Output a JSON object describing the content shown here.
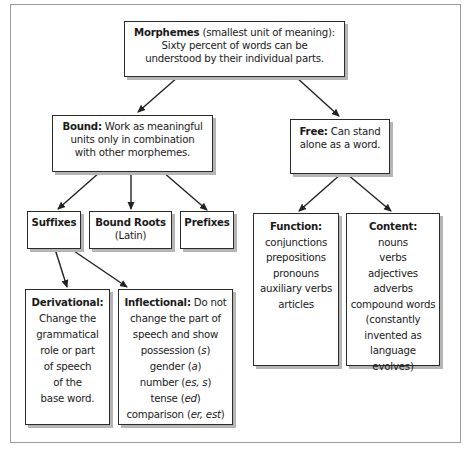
{
  "diagram": {
    "title": "Morphemes",
    "nodes": {
      "morphemes": {
        "heading": "Morphemes",
        "heading_suffix": " (smallest unit of meaning):",
        "lines": [
          "Sixty percent of words can be",
          "understood by their individual parts."
        ]
      },
      "bound": {
        "heading": "Bound:",
        "heading_suffix": " Work as meaningful",
        "lines": [
          "units only in combination",
          "with other morphemes."
        ]
      },
      "free": {
        "heading": "Free:",
        "heading_suffix": " Can stand",
        "lines": [
          "alone as a word."
        ]
      },
      "suffixes": {
        "heading": "Suffixes"
      },
      "bound_roots": {
        "heading": "Bound Roots",
        "lines": [
          "(Latin)"
        ]
      },
      "prefixes": {
        "heading": "Prefixes"
      },
      "function": {
        "heading": "Function:",
        "lines": [
          "conjunctions",
          "prepositions",
          "pronouns",
          "auxiliary verbs",
          "articles"
        ]
      },
      "content": {
        "heading": "Content:",
        "lines": [
          "nouns",
          "verbs",
          "adjectives",
          "adverbs",
          "compound words",
          "(constantly",
          "invented as",
          "language evolves)"
        ]
      },
      "derivational": {
        "heading": "Derivational:",
        "lines": [
          "Change the",
          "grammatical",
          "role or part",
          "of speech",
          "of the",
          "base word."
        ]
      },
      "inflectional": {
        "heading": "Inflectional:",
        "heading_suffix": " Do not",
        "lines": [
          "change the part of",
          "speech and show"
        ],
        "examples": [
          {
            "label": "possession (",
            "affix": "s",
            "close": ")"
          },
          {
            "label": "gender (",
            "affix": "a",
            "close": ")"
          },
          {
            "label": "number (",
            "affix": "es, s",
            "close": ")"
          },
          {
            "label": "tense (",
            "affix": "ed",
            "close": ")"
          },
          {
            "label": "comparison (",
            "affix": "er, est",
            "close": ")"
          }
        ]
      }
    },
    "edges": [
      [
        "morphemes",
        "bound"
      ],
      [
        "morphemes",
        "free"
      ],
      [
        "bound",
        "suffixes"
      ],
      [
        "bound",
        "bound_roots"
      ],
      [
        "bound",
        "prefixes"
      ],
      [
        "free",
        "function"
      ],
      [
        "free",
        "content"
      ],
      [
        "suffixes",
        "derivational"
      ],
      [
        "suffixes",
        "inflectional"
      ]
    ]
  }
}
